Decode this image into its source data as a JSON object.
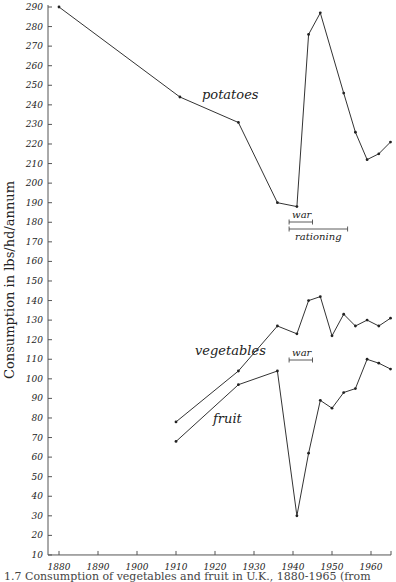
{
  "chart_data": {
    "type": "line",
    "title": "",
    "caption": "1.7 Consumption of vegetables and fruit in U.K., 1880-1965 (from",
    "xlabel": "",
    "ylabel": "Consumption in lbs/hd/annum",
    "xlim": [
      1878,
      1966
    ],
    "ylim": [
      10,
      290
    ],
    "grid": false,
    "x_ticks": [
      1880,
      1890,
      1900,
      1910,
      1920,
      1930,
      1940,
      1950,
      1960
    ],
    "y_ticks": [
      10,
      20,
      30,
      40,
      50,
      60,
      70,
      80,
      90,
      100,
      110,
      120,
      130,
      140,
      150,
      160,
      170,
      180,
      190,
      200,
      210,
      220,
      230,
      240,
      250,
      260,
      270,
      280,
      290
    ],
    "series": [
      {
        "name": "potatoes",
        "x": [
          1880,
          1911,
          1926,
          1936,
          1941,
          1944,
          1947,
          1953,
          1956,
          1959,
          1962,
          1965
        ],
        "values": [
          290,
          244,
          231,
          190,
          188,
          276,
          287,
          246,
          226,
          212,
          215,
          221
        ]
      },
      {
        "name": "vegetables",
        "x": [
          1910,
          1926,
          1936,
          1941,
          1944,
          1947,
          1950,
          1953,
          1956,
          1959,
          1962,
          1965
        ],
        "values": [
          78,
          104,
          127,
          123,
          140,
          142,
          122,
          133,
          127,
          130,
          127,
          131
        ]
      },
      {
        "name": "fruit",
        "x": [
          1910,
          1926,
          1936,
          1941,
          1944,
          1947,
          1950,
          1953,
          1956,
          1959,
          1962,
          1965
        ],
        "values": [
          68,
          97,
          104,
          30,
          62,
          89,
          85,
          93,
          95,
          110,
          108,
          105
        ]
      }
    ],
    "annotations": [
      {
        "text": "war",
        "x_range": [
          1939,
          1945
        ],
        "near": "potatoes"
      },
      {
        "text": "rationing",
        "x_range": [
          1939,
          1954
        ],
        "near": "potatoes"
      },
      {
        "text": "war",
        "x_range": [
          1939,
          1945
        ],
        "near": "vegetables"
      }
    ]
  }
}
